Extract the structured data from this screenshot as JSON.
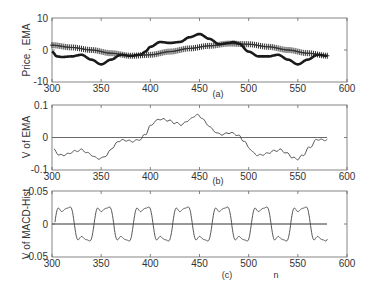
{
  "chart_data": [
    {
      "type": "line",
      "panel": "(a)",
      "title": "",
      "xlabel": "",
      "ylabel": "Price , EMA",
      "xlim": [
        300,
        600
      ],
      "ylim": [
        -10,
        10
      ],
      "xticks": [
        300,
        350,
        400,
        450,
        500,
        550,
        600
      ],
      "yticks": [
        -10,
        0,
        10
      ],
      "caption": "(a)",
      "series": [
        {
          "name": "Price",
          "style": "solid thick black",
          "x": [
            300,
            305,
            310,
            320,
            330,
            340,
            350,
            360,
            370,
            380,
            390,
            395,
            400,
            410,
            420,
            430,
            440,
            450,
            460,
            470,
            480,
            485,
            490,
            500,
            510,
            520,
            530,
            540,
            550,
            560,
            570,
            580
          ],
          "y": [
            -0.5,
            -2,
            -2.2,
            -2,
            -1.5,
            -3,
            -4.5,
            -3,
            -1.5,
            -1.8,
            -1.5,
            -0.5,
            1,
            2.5,
            2.2,
            2.5,
            4,
            5,
            3.5,
            1.8,
            2.2,
            2.5,
            2,
            -0.5,
            -2,
            -2,
            -1.5,
            -3,
            -4.5,
            -3,
            -1.5,
            -1.8
          ]
        },
        {
          "name": "EMA",
          "style": "+ markers",
          "x": [
            300,
            320,
            340,
            360,
            380,
            400,
            420,
            440,
            460,
            480,
            500,
            520,
            540,
            560,
            580
          ],
          "y": [
            1.5,
            0.8,
            0,
            -1,
            -1.8,
            -1.5,
            -0.5,
            0.5,
            1.3,
            2,
            1.8,
            1,
            0,
            -1,
            -1.8
          ]
        }
      ]
    },
    {
      "type": "line",
      "panel": "(b)",
      "title": "",
      "xlabel": "",
      "ylabel": "V of EMA",
      "xlim": [
        300,
        600
      ],
      "ylim": [
        -0.1,
        0.1
      ],
      "xticks": [
        300,
        350,
        400,
        450,
        500,
        550,
        600
      ],
      "yticks": [
        -0.1,
        0,
        0.1
      ],
      "caption": "(b)",
      "series": [
        {
          "name": "V of EMA",
          "x": [
            302,
            308,
            315,
            322,
            330,
            338,
            345,
            350,
            355,
            362,
            368,
            375,
            380,
            385,
            390,
            395,
            400,
            405,
            410,
            418,
            425,
            432,
            440,
            447,
            452,
            458,
            465,
            470,
            475,
            480,
            485,
            490,
            495,
            500,
            505,
            510,
            518,
            525,
            532,
            540,
            545,
            550,
            555,
            562,
            570,
            575,
            580
          ],
          "y": [
            -0.038,
            -0.055,
            -0.052,
            -0.043,
            -0.038,
            -0.05,
            -0.063,
            -0.065,
            -0.055,
            -0.03,
            -0.01,
            -0.008,
            -0.012,
            -0.01,
            -0.005,
            0.01,
            0.035,
            0.05,
            0.057,
            0.053,
            0.045,
            0.04,
            0.055,
            0.07,
            0.062,
            0.04,
            0.02,
            0.01,
            0.01,
            0.015,
            0.012,
            0.005,
            -0.01,
            -0.03,
            -0.048,
            -0.055,
            -0.05,
            -0.042,
            -0.038,
            -0.05,
            -0.063,
            -0.066,
            -0.055,
            -0.03,
            -0.005,
            -0.008,
            -0.006
          ]
        }
      ]
    },
    {
      "type": "line",
      "panel": "(c)",
      "title": "",
      "xlabel": "n",
      "ylabel": "V of MACD-Hist",
      "xlim": [
        300,
        600
      ],
      "ylim": [
        -0.05,
        0.05
      ],
      "xticks": [
        300,
        350,
        400,
        450,
        500,
        550,
        600
      ],
      "yticks": [
        -0.05,
        0,
        0.05
      ],
      "caption": "(c)",
      "series": [
        {
          "name": "V of MACD-Hist",
          "description": "Periodic oscillation, period ~40 samples, amplitude ~0.035, peaks near n=313,353,393,433,473,513,553; troughs near n=333,373,413,453,493,533,573",
          "x_start": 303,
          "x_end": 580,
          "period": 40,
          "amplitude": 0.035
        }
      ]
    }
  ],
  "axes": {
    "x_ticks": [
      "300",
      "350",
      "400",
      "450",
      "500",
      "550",
      "600"
    ],
    "a": {
      "ylabel": "Price , EMA",
      "yticks": [
        "10",
        "0",
        "-10"
      ],
      "caption": "(a)"
    },
    "b": {
      "ylabel": "V of EMA",
      "yticks": [
        "0.1",
        "0",
        "-0.1"
      ],
      "caption": "(b)"
    },
    "c": {
      "ylabel": "V of MACD-Hist",
      "yticks": [
        "0.05",
        "0",
        "-0.05"
      ],
      "caption": "(c)",
      "xlabel": "n"
    }
  },
  "colors": {
    "axis": "#555555",
    "price": "#1a1a1a",
    "ema": "#333333",
    "line": "#444444"
  }
}
